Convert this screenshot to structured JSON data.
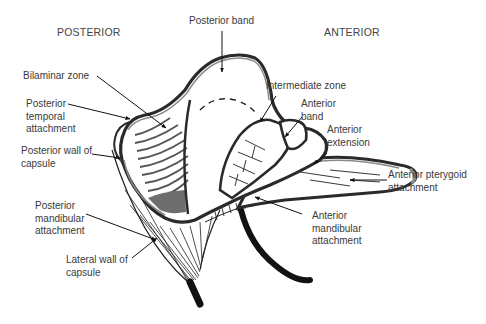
{
  "diagram": {
    "orientation": {
      "posterior": "POSTERIOR",
      "anterior": "ANTERIOR"
    },
    "labels": {
      "posterior_band": "Posterior band",
      "bilaminar_zone": "Bilaminar zone",
      "posterior_temporal_attachment": "Posterior\ntemporal\nattachment",
      "posterior_wall_of_capsule": "Posterior wall of\ncapsule",
      "posterior_mandibular_attachment": "Posterior\nmandibular\nattachment",
      "lateral_wall_of_capsule": "Lateral wall of\ncapsule",
      "intermediate_zone": "Intermediate zone",
      "anterior_band": "Anterior\nband",
      "anterior_extension": "Anterior\nextension",
      "anterior_pterygoid_attachment": "Anterior pterygoid\nattachment",
      "anterior_mandibular_attachment": "Anterior\nmandibular\nattachment"
    },
    "colors": {
      "outline": "#2a2a2a",
      "band_fill": "#8a8a8a",
      "shaded_region": "#6e6e6e",
      "text": "#3a3a3a",
      "background": "#ffffff"
    }
  }
}
